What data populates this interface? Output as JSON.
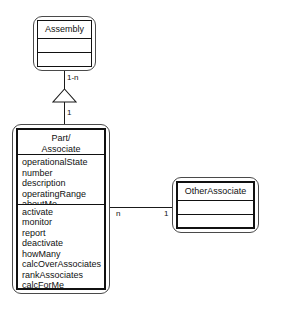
{
  "diagram": {
    "type": "uml-class-diagram",
    "title": "",
    "background_color": "#ffffff",
    "line_color": "#1a1a1a",
    "text_color": "#111111"
  },
  "classes": [
    {
      "id": "assembly",
      "name_lines": [
        "Assembly"
      ],
      "attributes": [],
      "operations": [],
      "border_style": "thin",
      "x": 33,
      "y": 16,
      "width": 63,
      "height": 55
    },
    {
      "id": "part_associate",
      "name_lines": [
        "Part/",
        "Associate"
      ],
      "attributes": [
        "operationalState",
        "number",
        "description",
        "operatingRange",
        "aboutMe"
      ],
      "operations": [
        "activate",
        "monitor",
        "report",
        "deactivate",
        "howMany",
        "calcOverAssociates",
        "rankAssociates",
        "calcForMe",
        "rateMe"
      ],
      "border_style": "thick",
      "x": 12,
      "y": 124,
      "width": 98,
      "height": 170
    },
    {
      "id": "other_associate",
      "name_lines": [
        "OtherAssociate"
      ],
      "attributes": [],
      "operations": [],
      "border_style": "thick",
      "x": 172,
      "y": 177,
      "width": 87,
      "height": 56
    }
  ],
  "relationships": [
    {
      "id": "assembly-part-aggregation",
      "kind": "aggregation",
      "from": "part_associate",
      "to": "assembly",
      "arrowhead": "hollow-triangle",
      "source_multiplicity": "1",
      "target_multiplicity": "1-n"
    },
    {
      "id": "part-otherassociate-association",
      "kind": "association",
      "from": "part_associate",
      "to": "other_associate",
      "arrowhead": "none",
      "source_multiplicity": "n",
      "target_multiplicity": "1"
    }
  ],
  "labels": {
    "assembly_end_multiplicity": "1-n",
    "part_generalization_multiplicity": "1",
    "part_association_multiplicity": "n",
    "other_association_multiplicity": "1"
  }
}
